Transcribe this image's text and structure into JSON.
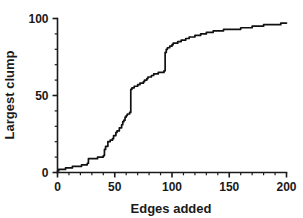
{
  "chart_data": {
    "type": "line",
    "title": "",
    "xlabel": "Edges added",
    "ylabel": "Largest clump",
    "xlim": [
      0,
      200
    ],
    "ylim": [
      0,
      100
    ],
    "grid": false,
    "legend": null,
    "xticks": [
      0,
      50,
      100,
      150,
      200
    ],
    "xtick_labels": [
      "0",
      "50",
      "100",
      "150",
      "200"
    ],
    "yticks": [
      0,
      50,
      100
    ],
    "ytick_labels": [
      "0",
      "50",
      "100"
    ],
    "x_minor_tick_step": 10,
    "y_minor_tick_step": 10,
    "series_color": "#111111",
    "series": [
      {
        "name": "largest clump",
        "x": [
          0,
          1,
          3,
          5,
          7,
          9,
          11,
          13,
          15,
          17,
          19,
          21,
          23,
          25,
          26,
          27,
          28,
          30,
          33,
          35,
          37,
          39,
          40,
          41,
          42,
          43,
          44,
          45,
          46,
          47,
          48,
          49,
          50,
          51,
          52,
          53,
          54,
          55,
          56,
          57,
          58,
          59,
          60,
          61,
          62,
          63,
          64,
          65,
          66,
          67,
          68,
          70,
          72,
          74,
          75,
          76,
          77,
          78,
          79,
          80,
          82,
          84,
          86,
          88,
          90,
          91,
          92,
          93,
          94,
          95,
          96,
          97,
          98,
          99,
          100,
          101,
          102,
          103,
          105,
          108,
          110,
          112,
          115,
          118,
          120,
          122,
          125,
          128,
          130,
          133,
          136,
          140,
          145,
          150,
          155,
          160,
          165,
          170,
          175,
          180,
          185,
          190,
          195,
          200
        ],
        "y": [
          1,
          2,
          2,
          2,
          3,
          3,
          3,
          4,
          4,
          4,
          4,
          5,
          5,
          5,
          6,
          9,
          9,
          9,
          9,
          10,
          10,
          10,
          11,
          15,
          17,
          17,
          20,
          20,
          21,
          21,
          22,
          24,
          24,
          26,
          27,
          27,
          29,
          29,
          31,
          33,
          34,
          36,
          37,
          38,
          38,
          39,
          54,
          55,
          55,
          56,
          56,
          57,
          58,
          58,
          59,
          60,
          60,
          61,
          62,
          62,
          63,
          64,
          64,
          65,
          65,
          65,
          65,
          66,
          78,
          80,
          81,
          81,
          82,
          82,
          83,
          84,
          84,
          84,
          85,
          86,
          86,
          87,
          88,
          88,
          89,
          89,
          90,
          90,
          91,
          91,
          92,
          92,
          93,
          93,
          93,
          94,
          94,
          95,
          95,
          96,
          96,
          96,
          97,
          97
        ]
      }
    ]
  },
  "axes": {
    "x_title": "Edges added",
    "y_title": "Largest clump"
  }
}
